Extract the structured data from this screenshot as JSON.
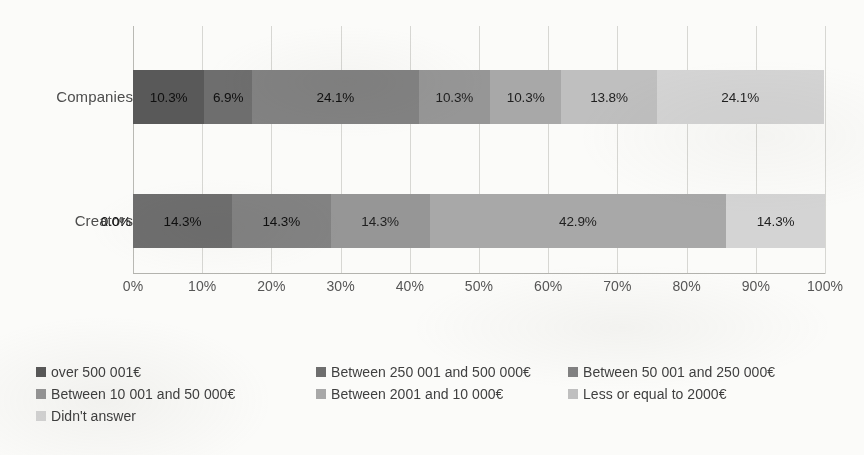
{
  "chart_data": {
    "type": "bar",
    "subtype": "stacked-horizontal-100pct",
    "title": "",
    "xlabel": "",
    "ylabel": "",
    "xlim": [
      0,
      100
    ],
    "grid": true,
    "legend_position": "bottom",
    "categories": [
      "Companies",
      "Creators"
    ],
    "x_ticks": [
      "0%",
      "10%",
      "20%",
      "30%",
      "40%",
      "50%",
      "60%",
      "70%",
      "80%",
      "90%",
      "100%"
    ],
    "x_tick_values": [
      0,
      10,
      20,
      30,
      40,
      50,
      60,
      70,
      80,
      90,
      100
    ],
    "series": [
      {
        "name": "over 500 001€",
        "color": "#595959",
        "values": [
          10.3,
          0.0
        ],
        "labels": [
          "10.3%",
          "0.0%"
        ]
      },
      {
        "name": "Between 250 001 and 500 000€",
        "color": "#6e6e6e",
        "values": [
          6.9,
          14.3
        ],
        "labels": [
          "6.9%",
          "14.3%"
        ]
      },
      {
        "name": "Between 50 001 and 250 000€",
        "color": "#828282",
        "values": [
          24.1,
          14.3
        ],
        "labels": [
          "24.1%",
          "14.3%"
        ]
      },
      {
        "name": "Between 10 001 and 50 000€",
        "color": "#969696",
        "values": [
          10.3,
          14.3
        ],
        "labels": [
          "10.3%",
          "14.3%"
        ]
      },
      {
        "name": "Between 2001 and 10 000€",
        "color": "#a8a8a8",
        "values": [
          10.3,
          42.9
        ],
        "labels": [
          "10.3%",
          "42.9%"
        ]
      },
      {
        "name": "Less or equal to 2000€",
        "color": "#bfbfbf",
        "values": [
          13.8,
          0.0
        ],
        "labels": [
          "13.8%",
          ""
        ]
      },
      {
        "name": "Didn't answer",
        "color": "#d4d4d4",
        "values": [
          24.1,
          14.3
        ],
        "labels": [
          "24.1%",
          "14.3%"
        ]
      }
    ]
  },
  "axis": {
    "category_labels": [
      {
        "text": "Companies"
      },
      {
        "text": "Creators"
      }
    ]
  },
  "legend": {
    "entries": [
      {
        "label": "over 500 001€",
        "color": "#595959"
      },
      {
        "label": "Between 250 001 and 500 000€",
        "color": "#6e6e6e"
      },
      {
        "label": "Between 50 001 and 250 000€",
        "color": "#828282"
      },
      {
        "label": "Between 10 001 and 50 000€",
        "color": "#969696"
      },
      {
        "label": "Between 2001 and 10 000€",
        "color": "#a8a8a8"
      },
      {
        "label": "Less or equal to 2000€",
        "color": "#bfbfbf"
      },
      {
        "label": "Didn't answer",
        "color": "#d4d4d4"
      }
    ]
  }
}
